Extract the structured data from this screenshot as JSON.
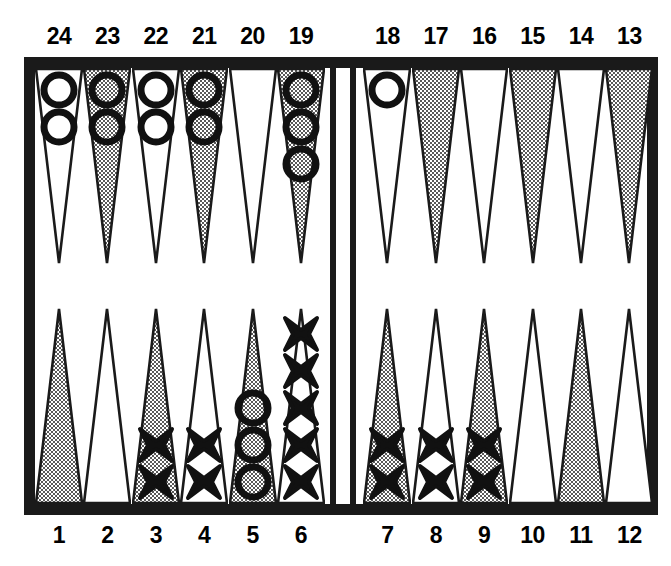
{
  "board": {
    "title": "Backgammon board diagram",
    "colors": {
      "frame": "#1a1a1a",
      "surface": "#ffffff",
      "point_shaded": "#b9b9b9",
      "point_plain": "#ffffff",
      "point_outline": "#1a1a1a",
      "checker_outline": "#111111"
    },
    "bar_label": "bar",
    "top_row_labels": [
      "24",
      "23",
      "22",
      "21",
      "20",
      "19",
      "18",
      "17",
      "16",
      "15",
      "14",
      "13"
    ],
    "bottom_row_labels": [
      "1",
      "2",
      "3",
      "4",
      "5",
      "6",
      "7",
      "8",
      "9",
      "10",
      "11",
      "12"
    ],
    "checker_glyphs": {
      "o": "O",
      "x": "X"
    },
    "points": [
      {
        "number": "24",
        "row": "top",
        "quadrant": "top-left",
        "slot": 0,
        "shaded": false,
        "checker_type": "o",
        "count": 2
      },
      {
        "number": "23",
        "row": "top",
        "quadrant": "top-left",
        "slot": 1,
        "shaded": true,
        "checker_type": "o",
        "count": 2
      },
      {
        "number": "22",
        "row": "top",
        "quadrant": "top-left",
        "slot": 2,
        "shaded": false,
        "checker_type": "o",
        "count": 2
      },
      {
        "number": "21",
        "row": "top",
        "quadrant": "top-left",
        "slot": 3,
        "shaded": true,
        "checker_type": "o",
        "count": 2
      },
      {
        "number": "20",
        "row": "top",
        "quadrant": "top-left",
        "slot": 4,
        "shaded": false,
        "checker_type": null,
        "count": 0
      },
      {
        "number": "19",
        "row": "top",
        "quadrant": "top-left",
        "slot": 5,
        "shaded": true,
        "checker_type": "o",
        "count": 3
      },
      {
        "number": "18",
        "row": "top",
        "quadrant": "top-right",
        "slot": 6,
        "shaded": false,
        "checker_type": "o",
        "count": 1
      },
      {
        "number": "17",
        "row": "top",
        "quadrant": "top-right",
        "slot": 7,
        "shaded": true,
        "checker_type": null,
        "count": 0
      },
      {
        "number": "16",
        "row": "top",
        "quadrant": "top-right",
        "slot": 8,
        "shaded": false,
        "checker_type": null,
        "count": 0
      },
      {
        "number": "15",
        "row": "top",
        "quadrant": "top-right",
        "slot": 9,
        "shaded": true,
        "checker_type": null,
        "count": 0
      },
      {
        "number": "14",
        "row": "top",
        "quadrant": "top-right",
        "slot": 10,
        "shaded": false,
        "checker_type": null,
        "count": 0
      },
      {
        "number": "13",
        "row": "top",
        "quadrant": "top-right",
        "slot": 11,
        "shaded": true,
        "checker_type": null,
        "count": 0
      },
      {
        "number": "1",
        "row": "bottom",
        "quadrant": "bottom-left",
        "slot": 0,
        "shaded": true,
        "checker_type": null,
        "count": 0
      },
      {
        "number": "2",
        "row": "bottom",
        "quadrant": "bottom-left",
        "slot": 1,
        "shaded": false,
        "checker_type": null,
        "count": 0
      },
      {
        "number": "3",
        "row": "bottom",
        "quadrant": "bottom-left",
        "slot": 2,
        "shaded": true,
        "checker_type": "x",
        "count": 2
      },
      {
        "number": "4",
        "row": "bottom",
        "quadrant": "bottom-left",
        "slot": 3,
        "shaded": false,
        "checker_type": "x",
        "count": 2
      },
      {
        "number": "5",
        "row": "bottom",
        "quadrant": "bottom-left",
        "slot": 4,
        "shaded": true,
        "checker_type": "o",
        "count": 3
      },
      {
        "number": "6",
        "row": "bottom",
        "quadrant": "bottom-left",
        "slot": 5,
        "shaded": false,
        "checker_type": "x",
        "count": 5
      },
      {
        "number": "7",
        "row": "bottom",
        "quadrant": "bottom-right",
        "slot": 6,
        "shaded": true,
        "checker_type": "x",
        "count": 2
      },
      {
        "number": "8",
        "row": "bottom",
        "quadrant": "bottom-right",
        "slot": 7,
        "shaded": false,
        "checker_type": "x",
        "count": 2
      },
      {
        "number": "9",
        "row": "bottom",
        "quadrant": "bottom-right",
        "slot": 8,
        "shaded": true,
        "checker_type": "x",
        "count": 2
      },
      {
        "number": "10",
        "row": "bottom",
        "quadrant": "bottom-right",
        "slot": 9,
        "shaded": false,
        "checker_type": null,
        "count": 0
      },
      {
        "number": "11",
        "row": "bottom",
        "quadrant": "bottom-right",
        "slot": 10,
        "shaded": true,
        "checker_type": null,
        "count": 0
      },
      {
        "number": "12",
        "row": "bottom",
        "quadrant": "bottom-right",
        "slot": 11,
        "shaded": false,
        "checker_type": null,
        "count": 0
      }
    ]
  }
}
